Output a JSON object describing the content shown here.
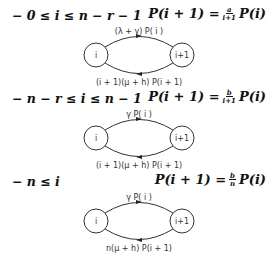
{
  "sections": [
    {
      "condition": "− 0 ≤ i ≤ n − r − 1",
      "equation_lhs": "P(i + 1) =",
      "frac_num": "a",
      "frac_den": "i+1",
      "equation_rhs": "P(i)",
      "state_left": "i",
      "state_right": "i+1",
      "top_label": "(λ + γ) P( i )",
      "bottom_label": "(i + 1)(μ + h) P(i + 1)"
    },
    {
      "condition": "− n − r ≤ i ≤ n − 1",
      "equation_lhs": "P(i + 1) =",
      "frac_num": "b",
      "frac_den": "i+1",
      "equation_rhs": "P(i)",
      "state_left": "i",
      "state_right": "i+1",
      "top_label": "γ P( i )",
      "bottom_label": "(i + 1)(μ + h) P(i + 1)"
    },
    {
      "condition": "− n ≤ i",
      "equation_lhs": "P(i + 1) =",
      "frac_num": "b",
      "frac_den": "n",
      "equation_rhs": "P(i)",
      "state_left": "i",
      "state_right": "i+1",
      "top_label": "γ P( i )",
      "bottom_label": "n(μ + h) P(i + 1)"
    }
  ]
}
